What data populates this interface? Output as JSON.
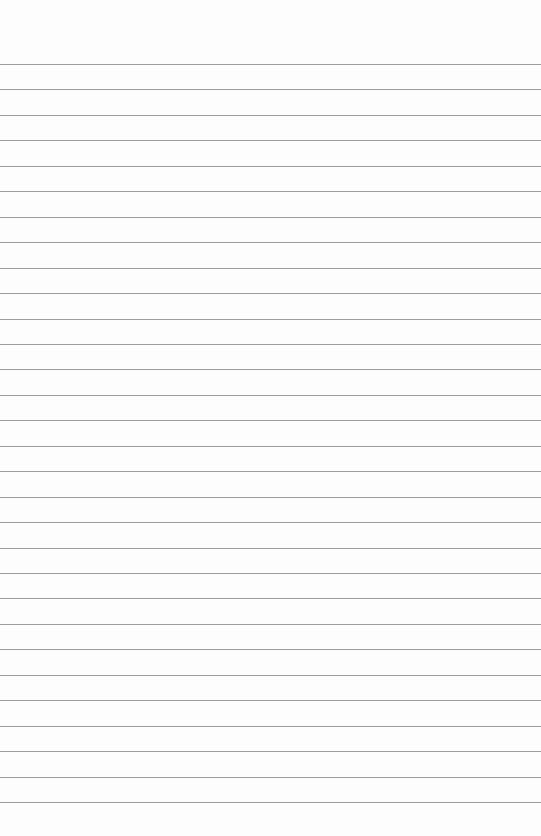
{
  "paper": {
    "type": "lined-paper",
    "background_color": "#fdfdfd",
    "line_color": "#8c8c8c",
    "first_line_y": 64,
    "line_spacing": 25.45,
    "line_count": 30
  }
}
